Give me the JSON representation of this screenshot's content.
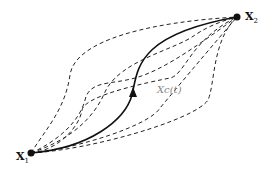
{
  "diagram": {
    "start_point": {
      "label": "X",
      "subscript": "1",
      "x": 31,
      "y": 153
    },
    "end_point": {
      "label": "X",
      "subscript": "2",
      "x": 237,
      "y": 17
    },
    "solid_curve": {
      "label": "Xc(t)",
      "style": "solid",
      "arrow": "mid, pointing up toward X2"
    },
    "dashed_paths_count": 6,
    "colors": {
      "line": "#111111",
      "label_gray": "#888888"
    }
  }
}
